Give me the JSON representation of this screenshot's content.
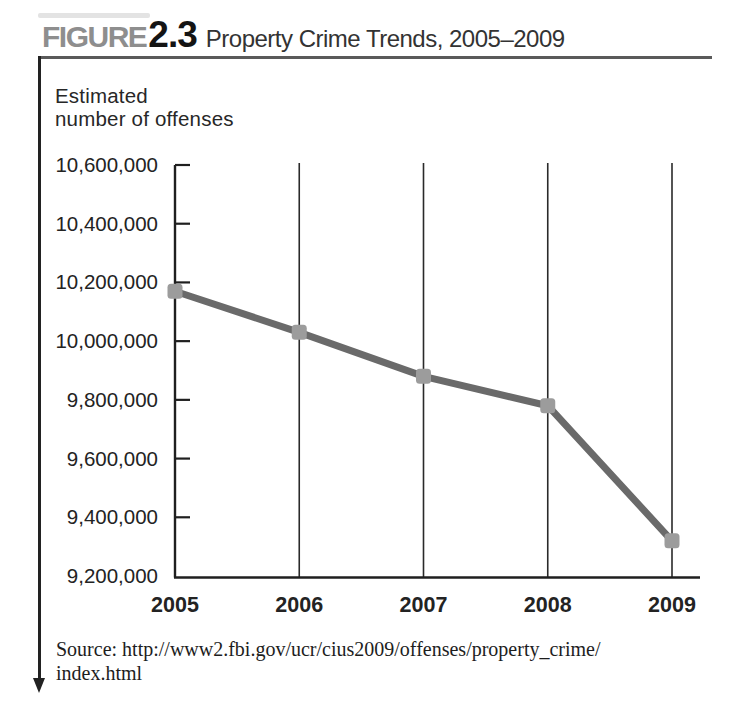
{
  "figure": {
    "label_prefix": "FIGURE",
    "label_number": "2.3",
    "title": "Property Crime Trends, 2005–2009"
  },
  "axis_label": {
    "line1": "Estimated",
    "line2": "number of offenses"
  },
  "source": {
    "line1": "Source: http://www2.fbi.gov/ucr/cius2009/offenses/property_crime/",
    "line2": "index.html"
  },
  "colors": {
    "figure_label": "#8e8e8e",
    "axis": "#1f1f1f",
    "gridline": "#2a2a2a",
    "series_line": "#6a6a6a",
    "marker_fill": "#9c9c9c",
    "text": "#232323"
  },
  "chart_data": {
    "type": "line",
    "title": "Property Crime Trends, 2005–2009",
    "categories": [
      "2005",
      "2006",
      "2007",
      "2008",
      "2009"
    ],
    "values": [
      10170000,
      10030000,
      9880000,
      9780000,
      9320000
    ],
    "xlabel": "",
    "ylabel": "Estimated number of offenses",
    "ylim": [
      9200000,
      10600000
    ],
    "ytick_step": 200000,
    "ytick_labels": [
      "10,600,000",
      "10,400,000",
      "10,200,000",
      "10,000,000",
      "9,800,000",
      "9,600,000",
      "9,400,000",
      "9,200,000"
    ],
    "grid": "vertical-at-each-year",
    "legend": "none"
  }
}
